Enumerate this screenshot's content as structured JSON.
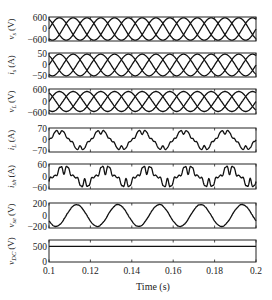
{
  "chart_data": {
    "type": "line",
    "layout": "7 vertically stacked subplots sharing x-axis",
    "xlabel": "Time (s)",
    "xlim": [
      0.1,
      0.2
    ],
    "xticks": [
      "0.1",
      "0.12",
      "0.14",
      "0.16",
      "0.18",
      "0.2"
    ],
    "grid": false,
    "panels": [
      {
        "id": "vs",
        "ylabel": "v_s (V)",
        "ylabel_main": "v",
        "ylabel_sub": "s",
        "unit": "(V)",
        "yticks": [
          "600",
          "0",
          "−600"
        ],
        "ylim": [
          -600,
          600
        ],
        "description": "three-phase sinusoidal source voltages, 50 Hz, amplitude ~600 V",
        "series": {
          "type": "three_phase_sine",
          "amplitude": 560,
          "freq_hz": 50,
          "phases_deg": [
            0,
            -120,
            120
          ]
        }
      },
      {
        "id": "is",
        "ylabel": "i_s (A)",
        "ylabel_main": "i",
        "ylabel_sub": "s",
        "unit": "(A)",
        "yticks": [
          "50",
          "0",
          "−50"
        ],
        "ylim": [
          -50,
          50
        ],
        "description": "three-phase sinusoidal source currents, 50 Hz, amplitude ~45 A",
        "series": {
          "type": "three_phase_sine",
          "amplitude": 45,
          "freq_hz": 50,
          "phases_deg": [
            0,
            -120,
            120
          ]
        }
      },
      {
        "id": "vL",
        "ylabel": "v_L (V)",
        "ylabel_main": "v",
        "ylabel_sub": "L",
        "unit": "(V)",
        "yticks": [
          "600",
          "0",
          "−600"
        ],
        "ylim": [
          -600,
          600
        ],
        "description": "three-phase load voltages, 50 Hz, amplitude ~500 V",
        "series": {
          "type": "three_phase_sine",
          "amplitude": 480,
          "freq_hz": 50,
          "phases_deg": [
            0,
            -120,
            120
          ]
        }
      },
      {
        "id": "iL",
        "ylabel": "i_L (A)",
        "ylabel_main": "i",
        "ylabel_sub": "L",
        "unit": "(A)",
        "yticks": [
          "70",
          "0",
          "−70"
        ],
        "ylim": [
          -70,
          70
        ],
        "description": "non-linear (stepped/distorted) load current, 50 Hz, peak ~55 A",
        "series": {
          "type": "distorted_sine",
          "amplitude": 50,
          "freq_hz": 50,
          "harmonics": [
            [
              5,
              0.18
            ],
            [
              7,
              0.1
            ],
            [
              11,
              0.06
            ]
          ]
        }
      },
      {
        "id": "ish",
        "ylabel": "i_sh (A)",
        "ylabel_main": "i",
        "ylabel_sub": "sh",
        "unit": "(A)",
        "yticks": [
          "60",
          "0",
          "−60"
        ],
        "ylim": [
          -60,
          60
        ],
        "description": "shunt compensator current, distorted waveform, peak ~55 A",
        "series": {
          "type": "distorted_sine",
          "amplitude": 38,
          "freq_hz": 50,
          "phase_deg": -40,
          "harmonics": [
            [
              5,
              0.35
            ],
            [
              7,
              0.22
            ],
            [
              11,
              0.12
            ],
            [
              13,
              0.08
            ]
          ]
        }
      },
      {
        "id": "vse",
        "ylabel": "v_se (V)",
        "ylabel_main": "v",
        "ylabel_sub": "se",
        "unit": "(V)",
        "yticks": [
          "200",
          "0",
          "−200"
        ],
        "ylim": [
          -200,
          200
        ],
        "description": "series compensator injected voltage, sinusoidal 50 Hz, amplitude ~180 V",
        "series": {
          "type": "sine",
          "amplitude": 175,
          "freq_hz": 50,
          "phase_deg": -150
        }
      },
      {
        "id": "vdc",
        "ylabel": "v_DC (V)",
        "ylabel_main": "v",
        "ylabel_sub": "DC",
        "unit": "(V)",
        "yticks": [
          "500",
          "0"
        ],
        "ylim": [
          0,
          700
        ],
        "description": "DC-link voltage, constant ~500 V",
        "series": {
          "type": "constant",
          "value": 500
        }
      }
    ]
  }
}
